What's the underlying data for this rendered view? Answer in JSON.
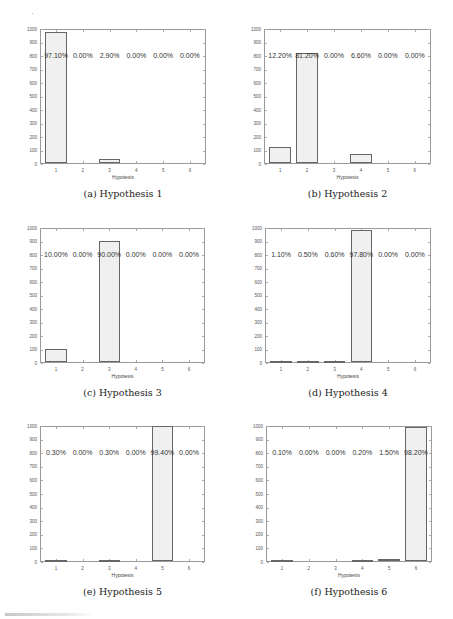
{
  "figure": {
    "footer_partial": "FIGURE"
  },
  "chart_data": [
    {
      "type": "bar",
      "panel": "a",
      "caption": "(a)  Hypothesis 1",
      "title": "",
      "xlabel": "Hypotesis",
      "ylabel": "",
      "categories": [
        "1",
        "2",
        "3",
        "4",
        "5",
        "6"
      ],
      "values": [
        971,
        0,
        29,
        0,
        0,
        0
      ],
      "percent_labels": [
        "97.10%",
        "0.00%",
        "2.90%",
        "0.00%",
        "0.00%",
        "0.00%"
      ],
      "yticks": [
        0,
        100,
        200,
        300,
        400,
        500,
        600,
        700,
        800,
        900,
        1000
      ],
      "ylim": [
        0,
        1000
      ],
      "grid": false
    },
    {
      "type": "bar",
      "panel": "b",
      "caption": "(b)  Hypothesis 2",
      "title": "",
      "xlabel": "Hypotesis",
      "ylabel": "",
      "categories": [
        "1",
        "2",
        "3",
        "4",
        "5",
        "6"
      ],
      "values": [
        122,
        812,
        0,
        66,
        0,
        0
      ],
      "percent_labels": [
        "12.20%",
        "81.20%",
        "0.00%",
        "6.60%",
        "0.00%",
        "0.00%"
      ],
      "yticks": [
        0,
        100,
        200,
        300,
        400,
        500,
        600,
        700,
        800,
        900,
        1000
      ],
      "ylim": [
        0,
        1000
      ],
      "grid": false
    },
    {
      "type": "bar",
      "panel": "c",
      "caption": "(c)  Hypothesis 3",
      "title": "",
      "xlabel": "Hypotesis",
      "ylabel": "",
      "categories": [
        "1",
        "2",
        "3",
        "4",
        "5",
        "6"
      ],
      "values": [
        100,
        0,
        900,
        0,
        0,
        0
      ],
      "percent_labels": [
        "10.00%",
        "0.00%",
        "90.00%",
        "0.00%",
        "0.00%",
        "0.00%"
      ],
      "yticks": [
        0,
        100,
        200,
        300,
        400,
        500,
        600,
        700,
        800,
        900,
        1000
      ],
      "ylim": [
        0,
        1000
      ],
      "grid": false
    },
    {
      "type": "bar",
      "panel": "d",
      "caption": "(d)  Hypothesis 4",
      "title": "",
      "xlabel": "Hypotesis",
      "ylabel": "",
      "categories": [
        "1",
        "2",
        "3",
        "4",
        "5",
        "6"
      ],
      "values": [
        11,
        5,
        6,
        978,
        0,
        0
      ],
      "percent_labels": [
        "1.10%",
        "0.50%",
        "0.60%",
        "97.80%",
        "0.00%",
        "0.00%"
      ],
      "yticks": [
        0,
        100,
        200,
        300,
        400,
        500,
        600,
        700,
        800,
        900,
        1000
      ],
      "ylim": [
        0,
        1000
      ],
      "grid": false
    },
    {
      "type": "bar",
      "panel": "e",
      "caption": "(e)  Hypothesis 5",
      "title": "",
      "xlabel": "Hypotesis",
      "ylabel": "",
      "categories": [
        "1",
        "2",
        "3",
        "4",
        "5",
        "6"
      ],
      "values": [
        3,
        0,
        3,
        0,
        994,
        0
      ],
      "percent_labels": [
        "0.30%",
        "0.00%",
        "0.30%",
        "0.00%",
        "99.40%",
        "0.00%"
      ],
      "yticks": [
        0,
        100,
        200,
        300,
        400,
        500,
        600,
        700,
        800,
        900,
        1000
      ],
      "ylim": [
        0,
        1000
      ],
      "grid": false
    },
    {
      "type": "bar",
      "panel": "f",
      "caption": "(f)  Hypothesis 6",
      "title": "",
      "xlabel": "Hypotesis",
      "ylabel": "",
      "categories": [
        "1",
        "2",
        "3",
        "4",
        "5",
        "6"
      ],
      "values": [
        1,
        0,
        0,
        2,
        15,
        982
      ],
      "percent_labels": [
        "0.10%",
        "0.00%",
        "0.00%",
        "0.20%",
        "1.50%",
        "98.20%"
      ],
      "yticks": [
        0,
        100,
        200,
        300,
        400,
        500,
        600,
        700,
        800,
        900,
        1000
      ],
      "ylim": [
        0,
        1000
      ],
      "grid": false
    }
  ]
}
